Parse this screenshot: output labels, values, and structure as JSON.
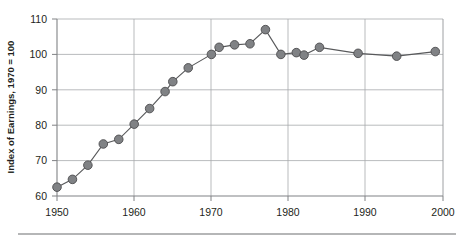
{
  "chart_data": {
    "type": "line",
    "title": "",
    "subtitle": "",
    "xlabel": "",
    "ylabel": "Index of Earnings, 1970 = 100",
    "xlim": [
      1950,
      2000
    ],
    "ylim": [
      60,
      110
    ],
    "xticks": [
      1950,
      1960,
      1970,
      1980,
      1990,
      2000
    ],
    "xticklabels": [
      "1950",
      "1960",
      "1970",
      "1980",
      "1990",
      "2000"
    ],
    "yticks": [
      60,
      70,
      80,
      90,
      100,
      110
    ],
    "yticklabels": [
      "60",
      "70",
      "80",
      "90",
      "100",
      "110"
    ],
    "grid": "horizontal-and-vertical",
    "legend": "none",
    "marker": "filled-circle",
    "marker_color": "#808285",
    "line_color": "#58595b",
    "series": [
      {
        "name": "Index of Earnings",
        "x": [
          1950,
          1952,
          1954,
          1956,
          1958,
          1960,
          1962,
          1964,
          1965,
          1967,
          1970,
          1971,
          1973,
          1975,
          1977,
          1979,
          1981,
          1982,
          1984,
          1989,
          1994,
          1999
        ],
        "values": [
          62.5,
          64.7,
          68.7,
          74.7,
          76.0,
          80.3,
          84.7,
          89.5,
          92.3,
          96.2,
          100.0,
          102.0,
          102.7,
          103.0,
          107.0,
          100.0,
          100.5,
          99.8,
          102.0,
          100.3,
          99.5,
          100.8
        ]
      }
    ]
  },
  "figure": {
    "footer_rule_visible": true
  }
}
